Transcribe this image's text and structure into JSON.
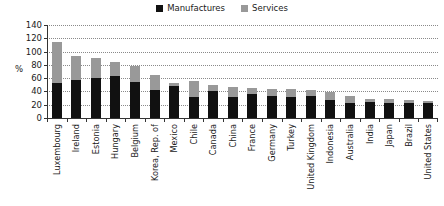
{
  "chart_data": {
    "type": "bar",
    "stacked": true,
    "title": "",
    "subtitle": "",
    "xlabel": "",
    "ylabel": "%",
    "ylim": [
      0,
      140
    ],
    "yticks": [
      140,
      120,
      100,
      80,
      60,
      40,
      20,
      0
    ],
    "grid": true,
    "legend_position": "top-center",
    "categories": [
      "Luxembourg",
      "Ireland",
      "Estonia",
      "Hungary",
      "Belgium",
      "Korea, Rep. of",
      "Mexico",
      "Chile",
      "Canada",
      "China",
      "France",
      "Germany",
      "Turkey",
      "United Kingdom",
      "Indonesia",
      "Australia",
      "India",
      "Japan",
      "Brazil",
      "United States"
    ],
    "series": [
      {
        "name": "Manufactures",
        "color": "#111111",
        "values": [
          52,
          57,
          60,
          63,
          54,
          42,
          48,
          31,
          40,
          32,
          36,
          33,
          32,
          33,
          27,
          23,
          24,
          22,
          22,
          22
        ]
      },
      {
        "name": "Services",
        "color": "#999999",
        "values": [
          63,
          36,
          31,
          21,
          24,
          23,
          5,
          24,
          10,
          14,
          9,
          11,
          11,
          9,
          12,
          10,
          5,
          6,
          5,
          4
        ]
      }
    ],
    "totals": [
      115,
      93,
      91,
      84,
      78,
      65,
      53,
      55,
      50,
      46,
      45,
      44,
      43,
      42,
      39,
      33,
      29,
      28,
      27,
      26
    ]
  },
  "legend": {
    "entries": [
      {
        "label": "Manufactures",
        "color": "#111111"
      },
      {
        "label": "Services",
        "color": "#999999"
      }
    ]
  },
  "axis": {
    "ylabel": "%",
    "yticks": [
      "140",
      "120",
      "100",
      "80",
      "60",
      "40",
      "20",
      "0"
    ]
  }
}
